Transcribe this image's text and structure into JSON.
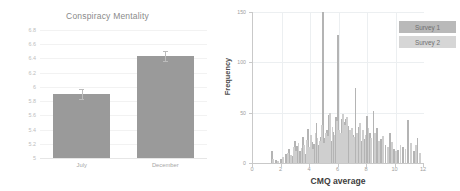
{
  "chart_data": [
    {
      "type": "bar",
      "title": "Conspiracy Mentality",
      "xlabel": "",
      "ylabel": "",
      "categories": [
        "July",
        "December"
      ],
      "values": [
        5.9,
        6.43
      ],
      "errors": [
        0.07,
        0.07
      ],
      "ylim": [
        5,
        6.8
      ],
      "yticks": [
        5,
        5.2,
        5.4,
        5.6,
        5.8,
        6,
        6.2,
        6.4,
        6.6,
        6.8
      ],
      "ytick_labels": [
        "5",
        "5.2",
        "5.4",
        "5.6",
        "5.8",
        "6",
        "6.2",
        "6.4",
        "6.6",
        "6.8"
      ],
      "grid": "horizontal",
      "legend": "none",
      "bar_color": "#9a9a9a",
      "error_color": "#bcbcbc"
    },
    {
      "type": "bar",
      "subtype": "histogram",
      "title": "",
      "xlabel": "CMQ average",
      "ylabel": "Frequency",
      "xlim": [
        0,
        12
      ],
      "ylim": [
        0,
        150
      ],
      "xticks": [
        0,
        2,
        4,
        6,
        8,
        10,
        12
      ],
      "xtick_labels": [
        "0",
        "2",
        "4",
        "6",
        "8",
        "10",
        "12"
      ],
      "yticks": [
        0,
        50,
        100,
        150
      ],
      "ytick_labels": [
        "0",
        "50",
        "100",
        "150"
      ],
      "grid": "both",
      "legend_position": "top-right",
      "series": [
        {
          "name": "Survey 1",
          "color": "#b4b4b4",
          "bins": [
            1.35,
            1.6,
            1.95,
            2.3,
            2.55,
            2.75,
            2.95,
            3.1,
            3.3,
            3.5,
            3.7,
            3.85,
            4.0,
            4.15,
            4.3,
            4.45,
            4.6,
            4.75,
            4.9,
            5.05,
            5.2,
            5.35,
            5.5,
            5.65,
            5.8,
            5.95,
            6.1,
            6.25,
            6.4,
            6.55,
            6.7,
            6.85,
            7.0,
            7.2,
            7.4,
            7.6,
            7.8,
            8.0,
            8.2,
            8.45,
            8.7,
            9.0,
            9.3,
            9.6,
            9.9,
            10.2,
            10.5,
            10.9,
            11.3,
            11.55
          ],
          "values": [
            12,
            3,
            4,
            9,
            14,
            7,
            22,
            17,
            12,
            26,
            9,
            34,
            11,
            21,
            19,
            40,
            18,
            26,
            150,
            25,
            33,
            48,
            22,
            31,
            46,
            127,
            20,
            44,
            41,
            44,
            37,
            30,
            28,
            75,
            36,
            22,
            24,
            47,
            30,
            52,
            35,
            24,
            18,
            30,
            14,
            13,
            16,
            43,
            12,
            25
          ]
        },
        {
          "name": "Survey 2",
          "color": "#cfcfcf",
          "bins": [
            1.4,
            1.75,
            2.1,
            2.45,
            2.65,
            2.85,
            3.0,
            3.2,
            3.4,
            3.6,
            3.78,
            3.92,
            4.08,
            4.22,
            4.38,
            4.52,
            4.68,
            4.82,
            4.98,
            5.12,
            5.28,
            5.42,
            5.58,
            5.72,
            5.88,
            6.02,
            6.18,
            6.32,
            6.48,
            6.62,
            6.78,
            6.92,
            7.1,
            7.3,
            7.5,
            7.7,
            7.9,
            8.1,
            8.3,
            8.55,
            8.85,
            9.15,
            9.45,
            9.75,
            10.05,
            10.35,
            10.7,
            11.1,
            11.45,
            11.7
          ],
          "values": [
            4,
            2,
            6,
            10,
            8,
            16,
            12,
            20,
            15,
            18,
            23,
            16,
            28,
            14,
            30,
            25,
            22,
            38,
            20,
            30,
            27,
            50,
            36,
            28,
            42,
            33,
            30,
            49,
            38,
            46,
            33,
            35,
            26,
            30,
            40,
            33,
            28,
            35,
            25,
            30,
            22,
            27,
            16,
            21,
            12,
            18,
            14,
            20,
            18,
            10
          ]
        }
      ]
    }
  ]
}
